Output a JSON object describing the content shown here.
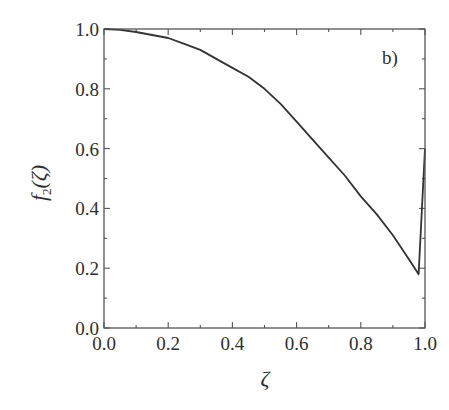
{
  "chart_data": {
    "type": "line",
    "title": "",
    "panel_label": "b)",
    "xlabel": "ζ",
    "ylabel": "f₂(ζ)",
    "ylabel_parts": {
      "f": "f",
      "sub": "2",
      "arg": "(ζ)"
    },
    "xlim": [
      0.0,
      1.0
    ],
    "ylim": [
      0.0,
      1.0
    ],
    "grid": false,
    "legend": null,
    "x_ticks": [
      0.0,
      0.2,
      0.4,
      0.6,
      0.8,
      1.0
    ],
    "x_tick_labels": [
      "0.0",
      "0.2",
      "0.4",
      "0.6",
      "0.8",
      "1.0"
    ],
    "x_minor_ticks": [
      0.1,
      0.3,
      0.5,
      0.7,
      0.9
    ],
    "y_ticks": [
      0.0,
      0.2,
      0.4,
      0.6,
      0.8,
      1.0
    ],
    "y_tick_labels": [
      "0.0",
      "0.2",
      "0.4",
      "0.6",
      "0.8",
      "1.0"
    ],
    "y_minor_ticks": [
      0.1,
      0.3,
      0.5,
      0.7,
      0.9
    ],
    "series": [
      {
        "name": "f2",
        "color": "#333333",
        "x": [
          0.0,
          0.05,
          0.1,
          0.15,
          0.2,
          0.25,
          0.3,
          0.35,
          0.4,
          0.45,
          0.5,
          0.55,
          0.6,
          0.65,
          0.7,
          0.75,
          0.8,
          0.85,
          0.9,
          0.95,
          0.98,
          1.0
        ],
        "y": [
          1.0,
          0.997,
          0.99,
          0.98,
          0.97,
          0.95,
          0.93,
          0.9,
          0.87,
          0.84,
          0.8,
          0.75,
          0.69,
          0.63,
          0.57,
          0.51,
          0.44,
          0.38,
          0.31,
          0.23,
          0.18,
          0.6
        ]
      }
    ]
  }
}
